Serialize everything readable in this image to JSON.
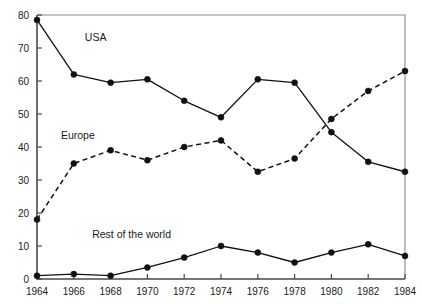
{
  "chart_data": {
    "type": "line",
    "title": "",
    "xlabel": "",
    "ylabel": "",
    "x": [
      1964,
      1966,
      1968,
      1970,
      1972,
      1974,
      1976,
      1978,
      1980,
      1982,
      1984
    ],
    "xtick_labels": [
      "1964",
      "1966",
      "1968",
      "1970",
      "1972",
      "1974",
      "1976",
      "1978",
      "1980",
      "1982",
      "1984"
    ],
    "ytick_labels": [
      "0",
      "10",
      "20",
      "30",
      "40",
      "50",
      "60",
      "70",
      "80"
    ],
    "yticks": [
      0,
      10,
      20,
      30,
      40,
      50,
      60,
      70,
      80
    ],
    "xlim": [
      1964,
      1984
    ],
    "ylim": [
      0,
      80
    ],
    "grid": false,
    "legend_position": "inline-annotations",
    "series": [
      {
        "name": "USA",
        "style": "solid",
        "label_x": 1966.6,
        "label_y": 72,
        "values": [
          78.5,
          62.0,
          59.5,
          60.5,
          54.0,
          49.0,
          60.5,
          59.5,
          44.5,
          35.5,
          32.5
        ]
      },
      {
        "name": "Europe",
        "style": "dashed",
        "label_x": 1965.3,
        "label_y": 42.5,
        "values": [
          18.0,
          35.0,
          39.0,
          36.0,
          40.0,
          42.0,
          32.5,
          36.5,
          48.5,
          57.0,
          63.0
        ]
      },
      {
        "name": "Rest of the world",
        "style": "solid",
        "label_x": 1967.0,
        "label_y": 12.5,
        "values": [
          1.0,
          1.5,
          1.0,
          3.5,
          6.5,
          10.0,
          8.0,
          5.0,
          8.0,
          10.5,
          7.0
        ]
      }
    ]
  }
}
